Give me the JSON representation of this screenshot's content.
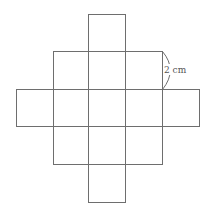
{
  "diagram": {
    "type": "cube-net-grid",
    "dimension_label": "2 cm",
    "rows": [
      {
        "row": 0,
        "cols": [
          2
        ]
      },
      {
        "row": 1,
        "cols": [
          1,
          2,
          3
        ]
      },
      {
        "row": 2,
        "cols": [
          0,
          1,
          2,
          3,
          4
        ]
      },
      {
        "row": 3,
        "cols": [
          1,
          2,
          3
        ]
      },
      {
        "row": 4,
        "cols": [
          2
        ]
      }
    ],
    "line_color": "#6e6e6e"
  }
}
